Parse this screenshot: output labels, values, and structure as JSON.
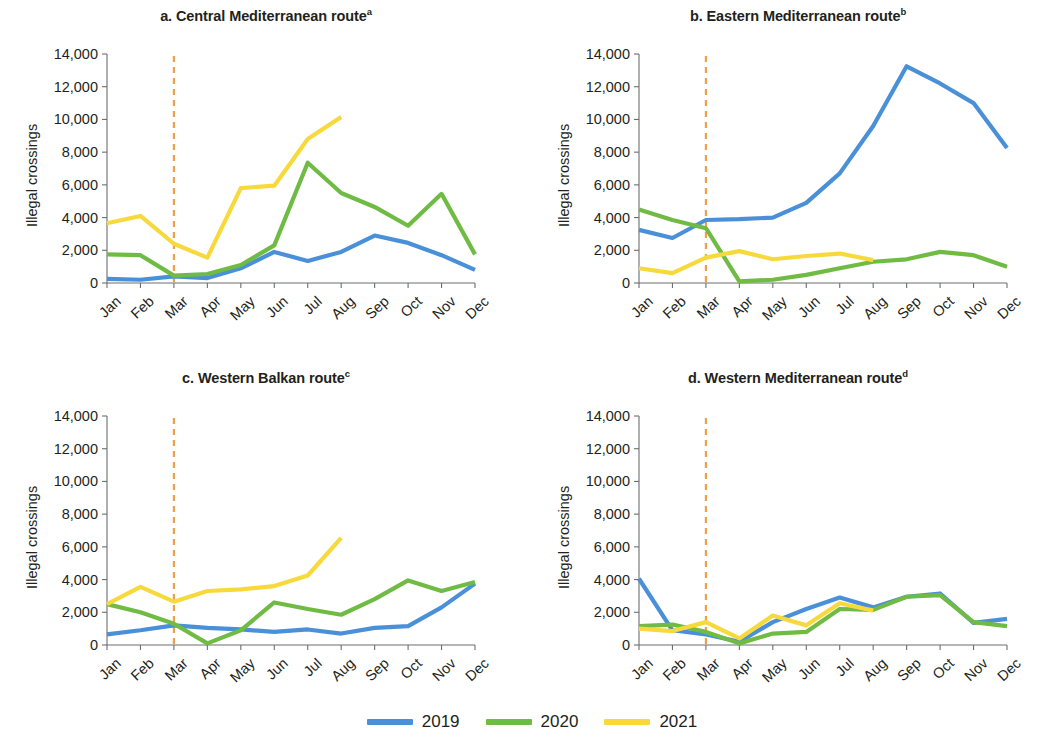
{
  "figure": {
    "ylabel": "Illegal crossings",
    "y_ticks": [
      "0",
      "2,000",
      "4,000",
      "6,000",
      "8,000",
      "10,000",
      "12,000",
      "14,000"
    ],
    "x_ticks": [
      "Jan",
      "Feb",
      "Mar",
      "Apr",
      "May",
      "Jun",
      "Jul",
      "Aug",
      "Sep",
      "Oct",
      "Nov",
      "Dec"
    ],
    "colors": {
      "series_2019": "#4a90d9",
      "series_2020": "#6fbb44",
      "series_2021": "#f7d93c",
      "marker_line": "#f0a04b",
      "axis": "#6d6e71",
      "text": "#231f20"
    },
    "legend": [
      {
        "label": "2019",
        "color": "#4a90d9"
      },
      {
        "label": "2020",
        "color": "#6fbb44"
      },
      {
        "label": "2021",
        "color": "#f7d93c"
      }
    ],
    "panels": [
      {
        "key": "a",
        "title": "a. Central Mediterranean route",
        "note": "a"
      },
      {
        "key": "b",
        "title": "b. Eastern Mediterranean route",
        "note": "b"
      },
      {
        "key": "c",
        "title": "c. Western Balkan route",
        "note": "c"
      },
      {
        "key": "d",
        "title": "d. Western Mediterranean route",
        "note": "d"
      }
    ]
  },
  "chart_data": [
    {
      "type": "line",
      "panel": "a",
      "title": "a. Central Mediterranean route",
      "xlabel": "",
      "ylabel": "Illegal crossings",
      "categories": [
        "Jan",
        "Feb",
        "Mar",
        "Apr",
        "May",
        "Jun",
        "Jul",
        "Aug",
        "Sep",
        "Oct",
        "Nov",
        "Dec"
      ],
      "ylim": [
        0,
        14000
      ],
      "ytick_step": 2000,
      "grid": false,
      "legend_position": "bottom-center",
      "annotations": [
        {
          "type": "vline",
          "at": "Mar",
          "style": "dashed",
          "color": "#f0a04b",
          "meaning": "COVID-19 onset"
        }
      ],
      "series": [
        {
          "name": "2019",
          "color": "#4a90d9",
          "values": [
            250,
            200,
            400,
            300,
            900,
            1900,
            1350,
            1900,
            2900,
            2450,
            1700,
            800
          ]
        },
        {
          "name": "2020",
          "color": "#6fbb44",
          "values": [
            1750,
            1700,
            450,
            550,
            1100,
            2300,
            7350,
            5500,
            4650,
            3500,
            5450,
            1750
          ]
        },
        {
          "name": "2021",
          "color": "#f7d93c",
          "values": [
            3650,
            4100,
            2400,
            1550,
            5800,
            5950,
            8800,
            10150,
            null,
            null,
            null,
            null
          ]
        }
      ]
    },
    {
      "type": "line",
      "panel": "b",
      "title": "b. Eastern Mediterranean route",
      "xlabel": "",
      "ylabel": "Illegal crossings",
      "categories": [
        "Jan",
        "Feb",
        "Mar",
        "Apr",
        "May",
        "Jun",
        "Jul",
        "Aug",
        "Sep",
        "Oct",
        "Nov",
        "Dec"
      ],
      "ylim": [
        0,
        14000
      ],
      "ytick_step": 2000,
      "grid": false,
      "legend_position": "bottom-center",
      "annotations": [
        {
          "type": "vline",
          "at": "Mar",
          "style": "dashed",
          "color": "#f0a04b",
          "meaning": "COVID-19 onset"
        }
      ],
      "series": [
        {
          "name": "2019",
          "color": "#4a90d9",
          "values": [
            3250,
            2750,
            3850,
            3900,
            4000,
            4900,
            6700,
            9600,
            13250,
            12200,
            11000,
            8250
          ]
        },
        {
          "name": "2020",
          "color": "#6fbb44",
          "values": [
            4500,
            3850,
            3350,
            100,
            200,
            500,
            900,
            1300,
            1450,
            1900,
            1700,
            1000
          ]
        },
        {
          "name": "2021",
          "color": "#f7d93c",
          "values": [
            900,
            600,
            1550,
            1950,
            1450,
            1650,
            1800,
            1400,
            null,
            null,
            null,
            null
          ]
        }
      ]
    },
    {
      "type": "line",
      "panel": "c",
      "title": "c. Western Balkan route",
      "xlabel": "",
      "ylabel": "Illegal crossings",
      "categories": [
        "Jan",
        "Feb",
        "Mar",
        "Apr",
        "May",
        "Jun",
        "Jul",
        "Aug",
        "Sep",
        "Oct",
        "Nov",
        "Dec"
      ],
      "ylim": [
        0,
        14000
      ],
      "ytick_step": 2000,
      "grid": false,
      "legend_position": "bottom-center",
      "annotations": [
        {
          "type": "vline",
          "at": "Mar",
          "style": "dashed",
          "color": "#f0a04b",
          "meaning": "COVID-19 onset"
        }
      ],
      "series": [
        {
          "name": "2019",
          "color": "#4a90d9",
          "values": [
            650,
            900,
            1200,
            1050,
            950,
            800,
            950,
            700,
            1050,
            1150,
            2300,
            3750
          ]
        },
        {
          "name": "2020",
          "color": "#6fbb44",
          "values": [
            2500,
            2000,
            1300,
            100,
            900,
            2600,
            2200,
            1850,
            2800,
            3950,
            3300,
            3850
          ]
        },
        {
          "name": "2021",
          "color": "#f7d93c",
          "values": [
            2500,
            3550,
            2650,
            3300,
            3400,
            3600,
            4250,
            6550,
            null,
            null,
            null,
            null
          ]
        }
      ]
    },
    {
      "type": "line",
      "panel": "d",
      "title": "d. Western Mediterranean route",
      "xlabel": "",
      "ylabel": "Illegal crossings",
      "categories": [
        "Jan",
        "Feb",
        "Mar",
        "Apr",
        "May",
        "Jun",
        "Jul",
        "Aug",
        "Sep",
        "Oct",
        "Nov",
        "Dec"
      ],
      "ylim": [
        0,
        14000
      ],
      "ytick_step": 2000,
      "grid": false,
      "legend_position": "bottom-center",
      "annotations": [
        {
          "type": "vline",
          "at": "Mar",
          "style": "dashed",
          "color": "#f0a04b",
          "meaning": "COVID-19 onset"
        }
      ],
      "series": [
        {
          "name": "2019",
          "color": "#4a90d9",
          "values": [
            4050,
            900,
            650,
            200,
            1400,
            2200,
            2900,
            2300,
            2950,
            3150,
            1350,
            1600
          ]
        },
        {
          "name": "2020",
          "color": "#6fbb44",
          "values": [
            1150,
            1250,
            800,
            100,
            700,
            800,
            2200,
            2150,
            2950,
            3050,
            1400,
            1150
          ]
        },
        {
          "name": "2021",
          "color": "#f7d93c",
          "values": [
            1000,
            850,
            1400,
            400,
            1800,
            1200,
            2550,
            2100,
            null,
            null,
            null,
            null
          ]
        }
      ]
    }
  ]
}
